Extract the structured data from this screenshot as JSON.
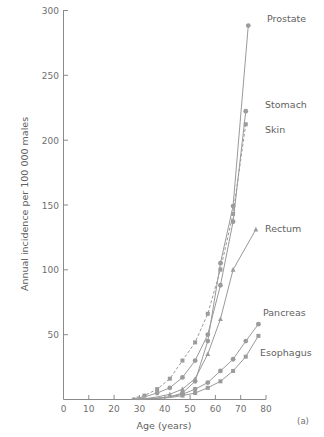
{
  "chart_data": {
    "type": "line",
    "title": "",
    "subtitle": "",
    "xlabel": "Age (years)",
    "ylabel": "Annual incidence per 100 000 males",
    "xlim": [
      0,
      80
    ],
    "ylim": [
      0,
      300
    ],
    "xticks": [
      0,
      10,
      20,
      30,
      40,
      50,
      60,
      70,
      80
    ],
    "yticks": [
      0,
      50,
      100,
      150,
      200,
      250,
      300
    ],
    "grid": false,
    "legend_position": "right-inline-labels",
    "panel_label": "(a)",
    "series": [
      {
        "name": "Prostate",
        "marker": "circle",
        "linestyle": "solid",
        "color": "#9b9b9b",
        "x": [
          27,
          32,
          37,
          42,
          47,
          52,
          57,
          62,
          67,
          73
        ],
        "y": [
          0,
          0.5,
          1,
          2,
          5,
          14,
          45,
          105,
          149,
          288
        ]
      },
      {
        "name": "Stomach",
        "marker": "circle",
        "linestyle": "solid",
        "color": "#9b9b9b",
        "x": [
          27,
          32,
          37,
          42,
          47,
          52,
          57,
          62,
          67,
          72
        ],
        "y": [
          0.5,
          2,
          5,
          9,
          17,
          30,
          50,
          88,
          137,
          222
        ]
      },
      {
        "name": "Skin",
        "marker": "square",
        "linestyle": "dashed",
        "color": "#9b9b9b",
        "x": [
          27,
          32,
          37,
          42,
          47,
          52,
          57,
          62,
          67,
          72
        ],
        "y": [
          1,
          3,
          8,
          16,
          30,
          44,
          66,
          100,
          143,
          212
        ]
      },
      {
        "name": "Rectum",
        "marker": "triangle",
        "linestyle": "solid",
        "color": "#9b9b9b",
        "x": [
          27,
          32,
          37,
          42,
          47,
          52,
          57,
          62,
          67,
          76
        ],
        "y": [
          0,
          0.5,
          2,
          4,
          8,
          16,
          35,
          62,
          100,
          131
        ]
      },
      {
        "name": "Pancreas",
        "marker": "circle",
        "linestyle": "solid",
        "color": "#9b9b9b",
        "x": [
          27,
          32,
          37,
          42,
          47,
          52,
          57,
          62,
          67,
          72,
          77
        ],
        "y": [
          0,
          0.5,
          1,
          2,
          4,
          8,
          13,
          22,
          31,
          45,
          58
        ]
      },
      {
        "name": "Esophagus",
        "marker": "square",
        "linestyle": "solid",
        "color": "#9b9b9b",
        "x": [
          27,
          32,
          37,
          42,
          47,
          52,
          57,
          62,
          67,
          72,
          77
        ],
        "y": [
          0,
          0.3,
          0.8,
          1.5,
          3,
          5,
          9,
          14,
          22,
          33,
          49
        ]
      }
    ],
    "series_labels": [
      {
        "text": "Prostate",
        "x": 267,
        "y": 22
      },
      {
        "text": "Stomach",
        "x": 265,
        "y": 108
      },
      {
        "text": "Skin",
        "x": 265,
        "y": 133
      },
      {
        "text": "Rectum",
        "x": 265,
        "y": 232
      },
      {
        "text": "Pancreas",
        "x": 263,
        "y": 316
      },
      {
        "text": "Esophagus",
        "x": 260,
        "y": 356
      }
    ]
  }
}
